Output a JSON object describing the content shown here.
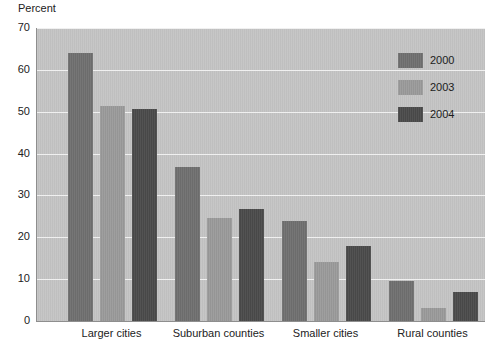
{
  "chart_data": {
    "type": "bar",
    "title": "",
    "subtitle": "",
    "xlabel": "",
    "ylabel": "Percent",
    "ylim": [
      0,
      70
    ],
    "yticks": [
      0,
      10,
      20,
      30,
      40,
      50,
      60,
      70
    ],
    "ytick_labels": [
      "0",
      "10",
      "20",
      "30",
      "40",
      "50",
      "60",
      "70"
    ],
    "grid": true,
    "legend_position": "top-right",
    "categories": [
      "Larger cities",
      "Suburban counties",
      "Smaller cities",
      "Rural counties"
    ],
    "series": [
      {
        "name": "2000",
        "color": "#6f6f6f",
        "values": [
          64.0,
          36.7,
          24.0,
          9.5
        ]
      },
      {
        "name": "2003",
        "color": "#9a9a9a",
        "values": [
          51.4,
          24.5,
          14.0,
          3.0
        ]
      },
      {
        "name": "2004",
        "color": "#4a4a4a",
        "values": [
          50.7,
          26.8,
          18.0,
          7.0
        ]
      }
    ],
    "plot_background": "#c3c3c3",
    "gridline_color": "#f0f0f0",
    "axis_color": "#8e8e8e"
  }
}
